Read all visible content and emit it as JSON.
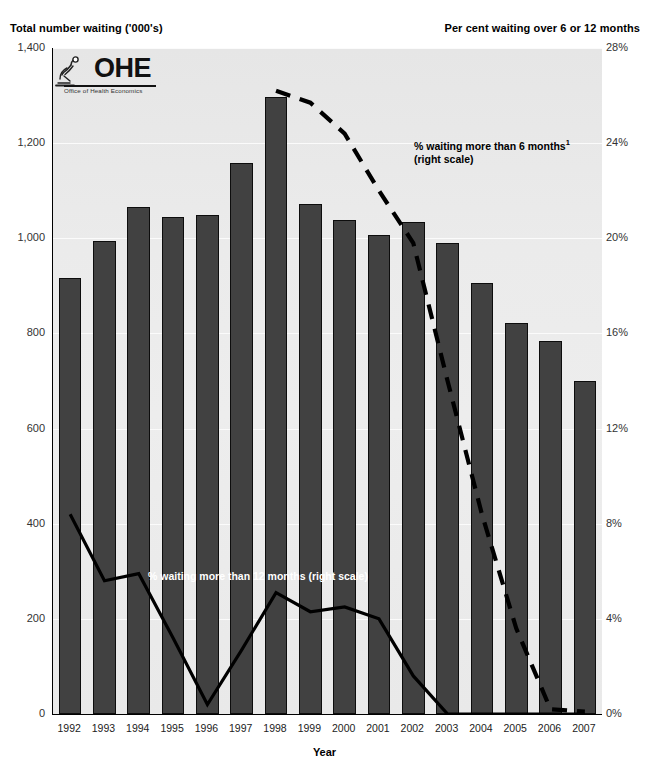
{
  "left_axis_title": "Total number waiting ('000's)",
  "right_axis_title": "Per cent waiting over 6 or 12 months",
  "x_axis_label": "Year",
  "logo": {
    "wordmark": "OHE",
    "subtitle": "Office of Health Economics",
    "mark_name": "microscope-icon"
  },
  "annotations": {
    "six_months_line1": "% waiting more than 6 months",
    "six_months_sup": "1",
    "six_months_line2": "(right scale)",
    "twelve_months": "% waiting more than 12 months (right scale)"
  },
  "colors": {
    "bar_fill": "#414141",
    "bar_border": "#0d0d0d",
    "line": "#000000",
    "plot_background": "#ebebeb",
    "gridline": "#fbfbfb"
  },
  "chart_data": {
    "type": "bar",
    "title": "",
    "subtitle": "",
    "xlabel": "Year",
    "ylabel": "Total number waiting ('000's)",
    "y2label": "Per cent waiting over 6 or 12 months",
    "grid": true,
    "legend_position": "inline-annotations",
    "categories": [
      "1992",
      "1993",
      "1994",
      "1995",
      "1996",
      "1997",
      "1998",
      "1999",
      "2000",
      "2001",
      "2002",
      "2003",
      "2004",
      "2005",
      "2006",
      "2007"
    ],
    "ylim": [
      0,
      1400
    ],
    "yticks": [
      0,
      200,
      400,
      600,
      800,
      1000,
      1200,
      1400
    ],
    "ytick_labels": [
      "0",
      "200",
      "400",
      "600",
      "800",
      "1,000",
      "1,200",
      "1,400"
    ],
    "y2lim": [
      0,
      28
    ],
    "y2ticks": [
      0,
      4,
      8,
      12,
      16,
      20,
      24,
      28
    ],
    "y2tick_labels": [
      "0%",
      "4%",
      "8%",
      "12%",
      "16%",
      "20%",
      "24%",
      "28%"
    ],
    "series": [
      {
        "name": "Total number waiting ('000's)",
        "type": "bar",
        "axis": "left",
        "values": [
          917,
          995,
          1065,
          1044,
          1048,
          1158,
          1298,
          1073,
          1038,
          1007,
          1035,
          990,
          905,
          822,
          784,
          700
        ]
      },
      {
        "name": "% waiting more than 12 months (right scale)",
        "type": "line",
        "style": "solid",
        "axis": "right",
        "values": [
          8.4,
          5.6,
          5.9,
          3.2,
          0.4,
          2.7,
          5.1,
          4.3,
          4.5,
          4.0,
          1.6,
          0.0,
          0.0,
          0.0,
          0.0,
          0.0
        ]
      },
      {
        "name": "% waiting more than 6 months (right scale)",
        "type": "line",
        "style": "dashed",
        "axis": "right",
        "values": [
          null,
          null,
          null,
          null,
          null,
          null,
          26.2,
          25.7,
          24.4,
          22.0,
          19.8,
          14.0,
          8.4,
          3.6,
          0.2,
          0.1
        ]
      }
    ]
  }
}
